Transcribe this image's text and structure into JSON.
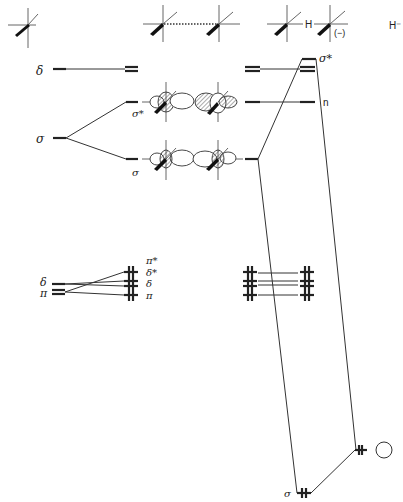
{
  "figure": {
    "type": "molecular orbital correlation diagram",
    "fragments": {
      "f1": {
        "name": "single-center fragment"
      },
      "f2": {
        "name": "dimer fragment (dotted bond)"
      },
      "f3": {
        "name": "hydride-bridged fragment",
        "bridge_label": "H",
        "charge_label": "(−)"
      },
      "f4": {
        "name": "hydride",
        "label": "H⁻"
      }
    },
    "labels": {
      "delta_left": "δ",
      "sigma_left": "σ",
      "sigma_star_mid": "σ*",
      "sigma_mid": "σ",
      "sigma_star_right": "σ*",
      "n_right": "n",
      "delta_low_left": "δ",
      "pi_low_left": "π",
      "pi_star": "π*",
      "delta_star": "δ*",
      "delta": "δ",
      "pi": "π",
      "sigma_bottom": "σ"
    },
    "electron_marks": {
      "double_pair": "⫲",
      "pair": "++"
    }
  }
}
